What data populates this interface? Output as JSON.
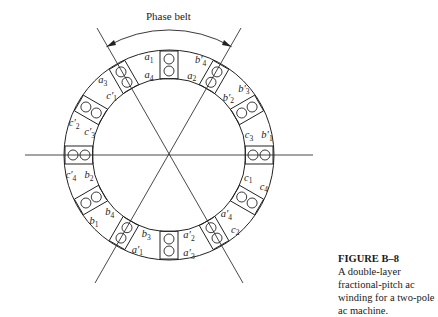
{
  "figure": {
    "phase_belt_label": "Phase belt",
    "caption_title": "FIGURE B–8",
    "caption_line1": "A double-layer fractional-pitch ac",
    "caption_line2": "winding for a two-pole ac machine.",
    "slots": [
      {
        "angle": 90,
        "labels": [
          "a1",
          "a4"
        ]
      },
      {
        "angle": 60,
        "labels": [
          "b'4",
          "a2"
        ]
      },
      {
        "angle": 30,
        "labels": [
          "b'3",
          "b'2"
        ]
      },
      {
        "angle": 0,
        "labels": [
          "b'1",
          "c3"
        ]
      },
      {
        "angle": -30,
        "labels": [
          "c4",
          "c1"
        ]
      },
      {
        "angle": -60,
        "labels": [
          "c2",
          "a'4"
        ]
      },
      {
        "angle": -90,
        "labels": [
          "a'3",
          "a'2"
        ]
      },
      {
        "angle": -120,
        "labels": [
          "a'1",
          "b3"
        ]
      },
      {
        "angle": -150,
        "labels": [
          "b1",
          "b4"
        ]
      },
      {
        "angle": 180,
        "labels": [
          "c'4",
          "b2"
        ]
      },
      {
        "angle": 150,
        "labels": [
          "c'2",
          "c'3"
        ]
      },
      {
        "angle": 120,
        "labels": [
          "a3",
          "c'1"
        ]
      }
    ]
  }
}
